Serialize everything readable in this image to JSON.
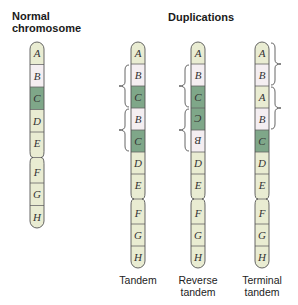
{
  "titles": {
    "normal_line1": "Normal",
    "normal_line2": "chromosome",
    "duplications": "Duplications"
  },
  "colors": {
    "light": "#e9ecd2",
    "pink": "#f4eef1",
    "green": "#7fa789",
    "outline": "#555555"
  },
  "chromosomes": [
    {
      "id": "normal",
      "x": 30,
      "top": 42,
      "seg": 22.5,
      "width": 14,
      "arm1": [
        {
          "label": "A",
          "color": "light",
          "flip": false
        },
        {
          "label": "B",
          "color": "pink",
          "flip": false
        },
        {
          "label": "C",
          "color": "green",
          "flip": false
        },
        {
          "label": "D",
          "color": "light",
          "flip": false
        },
        {
          "label": "E",
          "color": "light",
          "flip": false
        }
      ],
      "arm2": [
        {
          "label": "F",
          "color": "light",
          "flip": false
        },
        {
          "label": "G",
          "color": "light",
          "flip": false
        },
        {
          "label": "H",
          "color": "light",
          "flip": false
        }
      ],
      "caption": [],
      "brackets": []
    },
    {
      "id": "tandem",
      "x": 131,
      "top": 42,
      "seg": 22,
      "width": 14,
      "arm1": [
        {
          "label": "A",
          "color": "light",
          "flip": false
        },
        {
          "label": "B",
          "color": "pink",
          "flip": false
        },
        {
          "label": "C",
          "color": "green",
          "flip": false
        },
        {
          "label": "B",
          "color": "pink",
          "flip": false
        },
        {
          "label": "C",
          "color": "green",
          "flip": false
        },
        {
          "label": "D",
          "color": "light",
          "flip": false
        },
        {
          "label": "E",
          "color": "light",
          "flip": false
        }
      ],
      "arm2": [
        {
          "label": "F",
          "color": "light",
          "flip": false
        },
        {
          "label": "G",
          "color": "light",
          "flip": false
        },
        {
          "label": "H",
          "color": "light",
          "flip": false
        }
      ],
      "caption": [
        "Tandem"
      ],
      "brackets": [
        {
          "side": "left",
          "from": 1,
          "to": 3
        },
        {
          "side": "left",
          "from": 3,
          "to": 5
        }
      ]
    },
    {
      "id": "reverse-tandem",
      "x": 191,
      "top": 42,
      "seg": 22,
      "width": 14,
      "arm1": [
        {
          "label": "A",
          "color": "light",
          "flip": false
        },
        {
          "label": "B",
          "color": "pink",
          "flip": false
        },
        {
          "label": "C",
          "color": "green",
          "flip": false
        },
        {
          "label": "C",
          "color": "green",
          "flip": true
        },
        {
          "label": "B",
          "color": "pink",
          "flip": true
        },
        {
          "label": "D",
          "color": "light",
          "flip": false
        },
        {
          "label": "E",
          "color": "light",
          "flip": false
        }
      ],
      "arm2": [
        {
          "label": "F",
          "color": "light",
          "flip": false
        },
        {
          "label": "G",
          "color": "light",
          "flip": false
        },
        {
          "label": "H",
          "color": "light",
          "flip": false
        }
      ],
      "caption": [
        "Reverse",
        "tandem"
      ],
      "brackets": [
        {
          "side": "left",
          "from": 1,
          "to": 3
        },
        {
          "side": "left",
          "from": 3,
          "to": 5
        }
      ]
    },
    {
      "id": "terminal-tandem",
      "x": 255,
      "top": 42,
      "seg": 22,
      "width": 14,
      "arm1": [
        {
          "label": "A",
          "color": "light",
          "flip": false
        },
        {
          "label": "B",
          "color": "pink",
          "flip": false
        },
        {
          "label": "A",
          "color": "light",
          "flip": false
        },
        {
          "label": "B",
          "color": "pink",
          "flip": false
        },
        {
          "label": "C",
          "color": "green",
          "flip": false
        },
        {
          "label": "D",
          "color": "light",
          "flip": false
        },
        {
          "label": "E",
          "color": "light",
          "flip": false
        }
      ],
      "arm2": [
        {
          "label": "F",
          "color": "light",
          "flip": false
        },
        {
          "label": "G",
          "color": "light",
          "flip": false
        },
        {
          "label": "H",
          "color": "light",
          "flip": false
        }
      ],
      "caption": [
        "Terminal",
        "tandem"
      ],
      "brackets": [
        {
          "side": "right",
          "from": 0,
          "to": 2
        },
        {
          "side": "right",
          "from": 2,
          "to": 4
        }
      ]
    }
  ]
}
